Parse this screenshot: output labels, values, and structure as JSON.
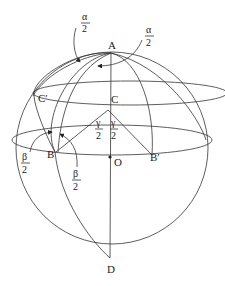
{
  "diagram": {
    "points": {
      "A": "A",
      "B": "B",
      "B_prime": "B′",
      "C": "C",
      "C_prime": "C′",
      "D": "D",
      "O": "O"
    },
    "angles": {
      "alpha_num": "α",
      "beta_num": "β",
      "gamma_num": "γ",
      "den": "2"
    },
    "colors": {
      "stroke": "#333333",
      "text": "#222222",
      "background": "#ffffff"
    }
  }
}
